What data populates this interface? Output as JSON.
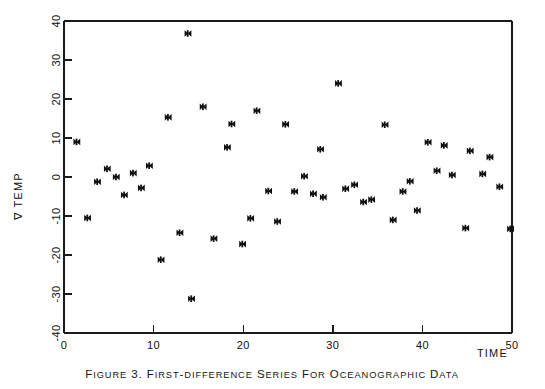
{
  "figure": {
    "caption_prefix": "FIGURE 3.",
    "caption_body": "FIRST-DIFFERENCE SERIES FOR OCEANOGRAPHIC DATA",
    "caption_full": "FIGURE 3.  FIRST-DIFFERENCE SERIES FOR OCEANOGRAPHIC DATA",
    "background_color": "#ffffff",
    "ink_color": "#101010"
  },
  "axes": {
    "y_axis_label": "∇ TEMP",
    "x_axis_label": "TIME",
    "x_tick_labels": [
      "0",
      "10",
      "20",
      "30",
      "40",
      "50"
    ],
    "y_tick_labels": [
      "40",
      "30",
      "20",
      "10",
      "0",
      "-10",
      "-20",
      "-30",
      "-40"
    ],
    "x_ticks": [
      0,
      10,
      20,
      30,
      40,
      50
    ],
    "y_ticks": [
      40,
      30,
      20,
      10,
      0,
      -10,
      -20,
      -30,
      -40
    ]
  },
  "chart_data": {
    "type": "scatter",
    "title": "FIGURE 3.  FIRST-DIFFERENCE SERIES FOR OCEANOGRAPHIC DATA",
    "xlabel": "TIME",
    "ylabel": "∇ TEMP",
    "xlim": [
      0,
      50
    ],
    "ylim": [
      -40,
      40
    ],
    "xticks": [
      0,
      10,
      20,
      30,
      40,
      50
    ],
    "yticks": [
      40,
      30,
      20,
      10,
      0,
      -10,
      -20,
      -30,
      -40
    ],
    "grid": false,
    "legend": null,
    "marker": "filled-bowtie",
    "series": [
      {
        "name": "First difference of oceanographic temperature",
        "points": [
          {
            "x": 1.4,
            "y": 9.0
          },
          {
            "x": 2.6,
            "y": -10.5
          },
          {
            "x": 3.7,
            "y": -1.2
          },
          {
            "x": 4.8,
            "y": 2.1
          },
          {
            "x": 5.8,
            "y": 0.0
          },
          {
            "x": 6.7,
            "y": -4.6
          },
          {
            "x": 7.7,
            "y": 1.0
          },
          {
            "x": 8.6,
            "y": -2.8
          },
          {
            "x": 9.5,
            "y": 2.9
          },
          {
            "x": 10.8,
            "y": -21.2
          },
          {
            "x": 11.6,
            "y": 15.3
          },
          {
            "x": 12.9,
            "y": -14.3
          },
          {
            "x": 13.8,
            "y": 36.8
          },
          {
            "x": 14.2,
            "y": -31.2
          },
          {
            "x": 15.5,
            "y": 18.0
          },
          {
            "x": 16.7,
            "y": -15.8
          },
          {
            "x": 18.2,
            "y": 7.6
          },
          {
            "x": 18.7,
            "y": 13.6
          },
          {
            "x": 19.9,
            "y": -17.2
          },
          {
            "x": 20.8,
            "y": -10.6
          },
          {
            "x": 21.5,
            "y": 17.0
          },
          {
            "x": 22.8,
            "y": -3.6
          },
          {
            "x": 23.8,
            "y": -11.4
          },
          {
            "x": 24.7,
            "y": 13.5
          },
          {
            "x": 25.7,
            "y": -3.7
          },
          {
            "x": 26.8,
            "y": 0.2
          },
          {
            "x": 27.8,
            "y": -4.3
          },
          {
            "x": 28.6,
            "y": 7.1
          },
          {
            "x": 28.9,
            "y": -5.2
          },
          {
            "x": 30.6,
            "y": 24.0
          },
          {
            "x": 31.4,
            "y": -3.0
          },
          {
            "x": 32.4,
            "y": -2.0
          },
          {
            "x": 33.4,
            "y": -6.4
          },
          {
            "x": 34.3,
            "y": -5.8
          },
          {
            "x": 35.8,
            "y": 13.4
          },
          {
            "x": 36.7,
            "y": -11.0
          },
          {
            "x": 37.8,
            "y": -3.7
          },
          {
            "x": 38.6,
            "y": -1.1
          },
          {
            "x": 39.4,
            "y": -8.6
          },
          {
            "x": 40.6,
            "y": 8.9
          },
          {
            "x": 41.6,
            "y": 1.6
          },
          {
            "x": 42.4,
            "y": 8.1
          },
          {
            "x": 43.3,
            "y": 0.5
          },
          {
            "x": 44.8,
            "y": -13.1
          },
          {
            "x": 45.3,
            "y": 6.7
          },
          {
            "x": 46.7,
            "y": 0.8
          },
          {
            "x": 47.5,
            "y": 5.1
          },
          {
            "x": 48.6,
            "y": -2.5
          },
          {
            "x": 49.8,
            "y": -13.3
          }
        ]
      }
    ]
  }
}
